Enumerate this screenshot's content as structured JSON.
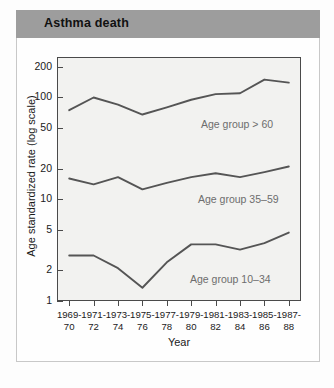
{
  "figure": {
    "title": "Asthma death"
  },
  "chart_data": {
    "type": "line",
    "title": "Asthma death",
    "xlabel": "Year",
    "ylabel": "Age standardized rate (log scale)",
    "yscale": "log",
    "ylim": [
      1,
      250
    ],
    "grid": false,
    "legend_position": "inline-annotation",
    "ytick_labels": [
      "200",
      "100",
      "50",
      "20",
      "10",
      "5",
      "2",
      "1"
    ],
    "ytick_values": [
      200,
      100,
      50,
      20,
      10,
      5,
      2,
      1
    ],
    "categories": [
      "1969-\n70",
      "1971-\n72",
      "1973-\n74",
      "1975-\n76",
      "1977-\n78",
      "1979-\n80",
      "1981-\n82",
      "1983-\n84",
      "1985-\n86",
      "1987-\n88"
    ],
    "xtick_labels": [
      {
        "top": "1969-",
        "bottom": "70"
      },
      {
        "top": "1971-",
        "bottom": "72"
      },
      {
        "top": "1973-",
        "bottom": "74"
      },
      {
        "top": "1975-",
        "bottom": "76"
      },
      {
        "top": "1977-",
        "bottom": "78"
      },
      {
        "top": "1979-",
        "bottom": "80"
      },
      {
        "top": "1981-",
        "bottom": "82"
      },
      {
        "top": "1983-",
        "bottom": "84"
      },
      {
        "top": "1985-",
        "bottom": "86"
      },
      {
        "top": "1987-",
        "bottom": "88"
      }
    ],
    "series": [
      {
        "name": "Age group > 60",
        "annotation": "Age group > 60",
        "color": "#555555",
        "values": [
          75,
          100,
          85,
          68,
          80,
          95,
          108,
          110,
          150,
          140
        ]
      },
      {
        "name": "Age group 35–59",
        "annotation": "Age group 35–59",
        "color": "#555555",
        "values": [
          16.0,
          14.0,
          16.5,
          12.5,
          14.5,
          16.5,
          18.0,
          16.5,
          18.5,
          21.0
        ]
      },
      {
        "name": "Age group 10–34",
        "annotation": "Age group 10–34",
        "color": "#555555",
        "values": [
          2.8,
          2.8,
          2.1,
          1.35,
          2.4,
          3.6,
          3.6,
          3.2,
          3.7,
          4.7
        ]
      }
    ]
  },
  "colors": {
    "title_bar": "#9d9d9d",
    "plot_background": "#f2f2f0",
    "axis": "#4a4a4a",
    "line": "#555555",
    "annotation_text": "#6d6d6d"
  }
}
